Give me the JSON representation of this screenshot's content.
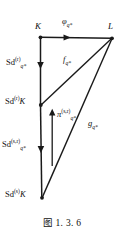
{
  "figure": {
    "caption": "图 1. 3. 6",
    "background_color": "#ffffff",
    "line_color": "#1a1a1a"
  },
  "vertices": [
    {
      "id": "K",
      "label": "K",
      "x": 40,
      "y": 37
    },
    {
      "id": "L",
      "label": "L",
      "x": 112,
      "y": 38
    },
    {
      "id": "SdrK",
      "label": "Sd",
      "sup": "(r)",
      "tail": "K",
      "x": 40,
      "y": 105
    },
    {
      "id": "SdsK",
      "label": "Sd",
      "sup": "(s)",
      "tail": "K",
      "x": 42,
      "y": 198
    }
  ],
  "labels": {
    "K": "K",
    "L": "L",
    "phi": {
      "base": "φ",
      "sub": "q*"
    },
    "f": {
      "base": "f",
      "sub": "q*"
    },
    "g": {
      "base": "g",
      "sub": "q*"
    },
    "pi": {
      "base": "π",
      "sup": "(s,r)",
      "sub": "q*"
    },
    "sd_r_q": {
      "base": "Sd",
      "sup": "(r)",
      "sub": "q*"
    },
    "sd_r_K": {
      "base": "Sd",
      "sup": "(r)",
      "tail": "K"
    },
    "sd_sr_q": {
      "base": "Sd",
      "sup": "(s,r)",
      "sub": "q*"
    },
    "sd_s_K": {
      "base": "Sd",
      "sup": "(s)",
      "tail": "K"
    }
  },
  "edges": [
    {
      "name": "phi-arrow",
      "from": "K",
      "to": "L",
      "label": "phi",
      "style": "arrow-right"
    },
    {
      "name": "sd-r-arrow",
      "from": "K",
      "to": "SdrK",
      "label": "sd_r_q",
      "style": "arrow-down"
    },
    {
      "name": "sd-sr-arrow",
      "from": "SdrK",
      "to": "SdsK",
      "label": "sd_sr_q",
      "style": "arrow-down"
    },
    {
      "name": "f-diagonal",
      "from": "SdrK",
      "to": "L",
      "label": "f",
      "style": "line"
    },
    {
      "name": "g-diagonal",
      "from": "SdsK",
      "to": "L",
      "label": "g",
      "style": "line"
    },
    {
      "name": "pi-arrow",
      "from": "SdsK",
      "to": "SdrK",
      "label": "pi",
      "style": "arrow-up"
    }
  ]
}
